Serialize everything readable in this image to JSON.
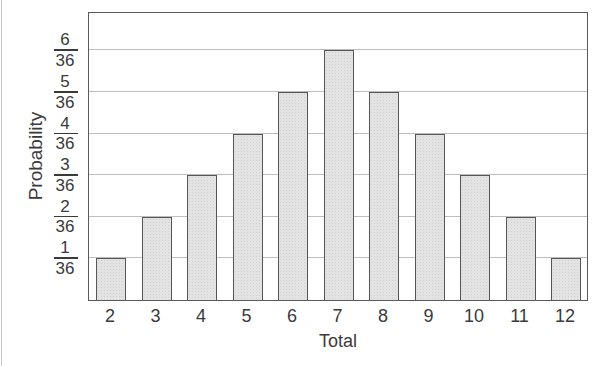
{
  "chart_data": {
    "type": "bar",
    "title": "",
    "xlabel": "Total",
    "ylabel": "Probability",
    "categories": [
      "2",
      "3",
      "4",
      "5",
      "6",
      "7",
      "8",
      "9",
      "10",
      "11",
      "12"
    ],
    "values": [
      0.02778,
      0.05556,
      0.08333,
      0.11111,
      0.13889,
      0.16667,
      0.13889,
      0.11111,
      0.08333,
      0.05556,
      0.02778
    ],
    "values_as_fraction": [
      "1/36",
      "2/36",
      "3/36",
      "4/36",
      "5/36",
      "6/36",
      "5/36",
      "4/36",
      "3/36",
      "2/36",
      "1/36"
    ],
    "numerators_over_36": [
      1,
      2,
      3,
      4,
      5,
      6,
      5,
      4,
      3,
      2,
      1
    ],
    "ytick_labels": [
      {
        "num": "1",
        "den": "36"
      },
      {
        "num": "2",
        "den": "36"
      },
      {
        "num": "3",
        "den": "36"
      },
      {
        "num": "4",
        "den": "36"
      },
      {
        "num": "5",
        "den": "36"
      },
      {
        "num": "6",
        "den": "36"
      }
    ],
    "ylim": [
      0,
      0.194
    ],
    "grid": "horizontal",
    "legend": null,
    "colors": {
      "bar_fill": "#e3e3e3",
      "bar_edge": "#555555",
      "grid": "#bdbdbd",
      "axis": "#5a5a5a",
      "text": "#3a3a3a"
    }
  }
}
